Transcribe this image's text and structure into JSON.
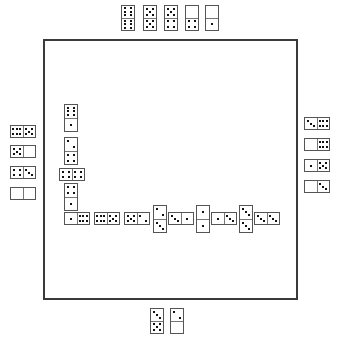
{
  "game": {
    "name": "Dominoes",
    "board_color": "#ffffff",
    "board_border_color": "#3a3a3a",
    "pip_color": "#111111"
  },
  "hands": {
    "top": {
      "player": "north",
      "tiles": [
        {
          "a": 6,
          "b": 6,
          "orient": "v",
          "x": 121,
          "y": 5,
          "w": 14,
          "h": 26
        },
        {
          "a": 5,
          "b": 5,
          "orient": "v",
          "x": 143,
          "y": 5,
          "w": 14,
          "h": 26
        },
        {
          "a": 5,
          "b": 4,
          "orient": "v",
          "x": 164,
          "y": 5,
          "w": 14,
          "h": 26
        },
        {
          "a": 0,
          "b": 4,
          "orient": "v",
          "x": 185,
          "y": 5,
          "w": 14,
          "h": 26
        },
        {
          "a": 0,
          "b": 1,
          "orient": "v",
          "x": 205,
          "y": 5,
          "w": 14,
          "h": 26
        }
      ]
    },
    "left": {
      "player": "west",
      "tiles": [
        {
          "a": 6,
          "b": 5,
          "orient": "h",
          "x": 10,
          "y": 125,
          "w": 26,
          "h": 13
        },
        {
          "a": 5,
          "b": 0,
          "orient": "h",
          "x": 10,
          "y": 145,
          "w": 26,
          "h": 13
        },
        {
          "a": 4,
          "b": 3,
          "orient": "h",
          "x": 10,
          "y": 166,
          "w": 26,
          "h": 13
        },
        {
          "a": 0,
          "b": 0,
          "orient": "h",
          "x": 10,
          "y": 187,
          "w": 26,
          "h": 13
        }
      ]
    },
    "right": {
      "player": "east",
      "tiles": [
        {
          "a": 3,
          "b": 6,
          "orient": "h",
          "x": 304,
          "y": 117,
          "w": 26,
          "h": 13
        },
        {
          "a": 0,
          "b": 6,
          "orient": "h",
          "x": 304,
          "y": 138,
          "w": 26,
          "h": 13
        },
        {
          "a": 1,
          "b": 5,
          "orient": "h",
          "x": 304,
          "y": 159,
          "w": 26,
          "h": 13
        },
        {
          "a": 0,
          "b": 3,
          "orient": "h",
          "x": 304,
          "y": 180,
          "w": 26,
          "h": 13
        }
      ]
    },
    "bottom": {
      "player": "south",
      "tiles": [
        {
          "a": 3,
          "b": 5,
          "orient": "v",
          "x": 150,
          "y": 308,
          "w": 14,
          "h": 26
        },
        {
          "a": 2,
          "b": 0,
          "orient": "v",
          "x": 170,
          "y": 308,
          "w": 14,
          "h": 26
        }
      ]
    }
  },
  "chain": {
    "tiles": [
      {
        "a": 6,
        "b": 1,
        "orient": "v",
        "x": 64,
        "y": 104,
        "w": 14,
        "h": 28
      },
      {
        "a": 2,
        "b": 4,
        "orient": "v",
        "x": 64,
        "y": 137,
        "w": 14,
        "h": 28
      },
      {
        "a": 4,
        "b": 4,
        "orient": "h",
        "x": 59,
        "y": 168,
        "w": 26,
        "h": 13
      },
      {
        "a": 4,
        "b": 1,
        "orient": "v",
        "x": 64,
        "y": 183,
        "w": 14,
        "h": 28
      },
      {
        "a": 1,
        "b": 6,
        "orient": "h",
        "x": 64,
        "y": 212,
        "w": 26,
        "h": 13
      },
      {
        "a": 6,
        "b": 5,
        "orient": "h",
        "x": 94,
        "y": 212,
        "w": 26,
        "h": 13
      },
      {
        "a": 5,
        "b": 2,
        "orient": "h",
        "x": 124,
        "y": 212,
        "w": 26,
        "h": 13
      },
      {
        "a": 2,
        "b": 3,
        "orient": "v",
        "x": 153,
        "y": 205,
        "w": 14,
        "h": 28
      },
      {
        "a": 3,
        "b": 1,
        "orient": "h",
        "x": 168,
        "y": 212,
        "w": 26,
        "h": 13
      },
      {
        "a": 1,
        "b": 1,
        "orient": "v",
        "x": 196,
        "y": 205,
        "w": 14,
        "h": 28
      },
      {
        "a": 1,
        "b": 3,
        "orient": "h",
        "x": 211,
        "y": 212,
        "w": 26,
        "h": 13
      },
      {
        "a": 3,
        "b": 3,
        "orient": "v",
        "x": 239,
        "y": 205,
        "w": 14,
        "h": 28
      },
      {
        "a": 3,
        "b": 3,
        "orient": "h",
        "x": 254,
        "y": 212,
        "w": 26,
        "h": 13
      }
    ]
  }
}
